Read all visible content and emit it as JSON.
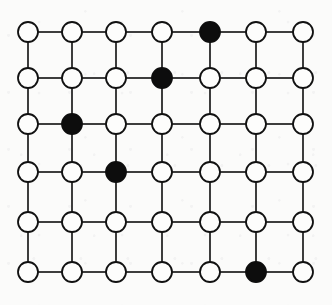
{
  "figure": {
    "type": "graph-diagram",
    "width": 332,
    "height": 305,
    "background_color": "#fbfbfa"
  },
  "graph_data": {
    "type": "lattice-graph",
    "rows": 6,
    "cols": 7,
    "node_count": 42,
    "edge_count": 71,
    "node_radius": 10,
    "node_styles": {
      "open": {
        "label": "open vertex",
        "fill": "#fdfdfc",
        "stroke": "#111111"
      },
      "filled": {
        "label": "filled vertex",
        "fill": "#0d0d0d",
        "stroke": "#0d0d0d"
      }
    },
    "column_x": [
      28,
      72,
      116,
      162,
      210,
      256,
      303
    ],
    "row_y": [
      32,
      78,
      124,
      172,
      222,
      272
    ],
    "filled_nodes": [
      {
        "row": 0,
        "col": 4
      },
      {
        "row": 1,
        "col": 3
      },
      {
        "row": 2,
        "col": 1
      },
      {
        "row": 3,
        "col": 2
      },
      {
        "row": 5,
        "col": 5
      }
    ],
    "node_states": [
      [
        "open",
        "open",
        "open",
        "open",
        "filled",
        "open",
        "open"
      ],
      [
        "open",
        "open",
        "open",
        "filled",
        "open",
        "open",
        "open"
      ],
      [
        "open",
        "filled",
        "open",
        "open",
        "open",
        "open",
        "open"
      ],
      [
        "open",
        "open",
        "filled",
        "open",
        "open",
        "open",
        "open"
      ],
      [
        "open",
        "open",
        "open",
        "open",
        "open",
        "open",
        "open"
      ],
      [
        "open",
        "open",
        "open",
        "open",
        "open",
        "filled",
        "open"
      ]
    ],
    "edges": {
      "horizontal": "every adjacent pair within each row",
      "vertical": "every adjacent pair within each column",
      "stroke_color": "#1a1a1a",
      "stroke_width": 1.7
    }
  }
}
